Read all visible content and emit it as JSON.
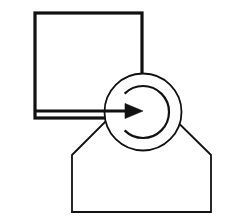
{
  "canvas": {
    "width": 242,
    "height": 221,
    "background_color": "#ffffff",
    "stroke_color": "#111111",
    "title": "Geometric Line Drawing"
  },
  "shapes": {
    "square": {
      "name": "Square",
      "x": 35,
      "y": 13,
      "width": 107,
      "height": 105,
      "stroke_width": 3.2,
      "fill": "none"
    },
    "circle": {
      "name": "Circle",
      "cx": 143,
      "cy": 112,
      "r": 38.5,
      "stroke_width": 1.8,
      "fill": "none"
    },
    "inner_arc": {
      "name": "Inner C Arc",
      "cx": 143,
      "cy": 112,
      "r": 26,
      "start_angle_deg": -135,
      "end_angle_deg": 135,
      "stroke_width": 2.2,
      "open_side": "left"
    },
    "arrow": {
      "name": "Arrow",
      "x1": 36,
      "y1": 111,
      "x2": 143,
      "y2": 111,
      "stroke_width": 3.0,
      "head_length": 18,
      "head_half_width": 7.5,
      "direction": "right"
    },
    "pentagon": {
      "name": "Pentagon House",
      "stroke_width": 1.8,
      "fill": "none",
      "points": "72,155 141,86 211,155 211,212 72,212",
      "vertices": [
        {
          "label": "left-shoulder",
          "x": 72,
          "y": 155
        },
        {
          "label": "apex",
          "x": 141,
          "y": 86
        },
        {
          "label": "right-shoulder",
          "x": 211,
          "y": 155
        },
        {
          "label": "bottom-right",
          "x": 211,
          "y": 212
        },
        {
          "label": "bottom-left",
          "x": 72,
          "y": 212
        }
      ]
    }
  },
  "accessibility": {
    "figure_description": "Line drawing of a square overlapping a circle with an inner C shaped arc, a right pointing arrow entering the circle, and a pentagon house shape below."
  }
}
